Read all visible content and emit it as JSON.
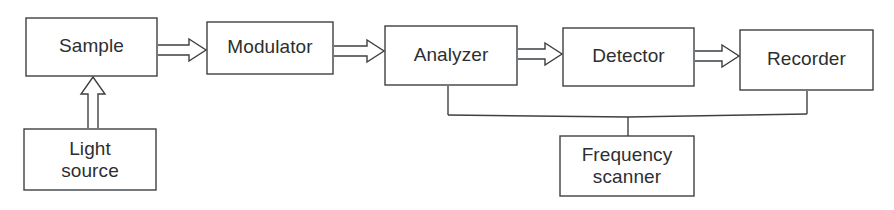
{
  "diagram": {
    "background_color": "#ffffff",
    "line_color": "#3d4043",
    "text_color": "#2c2f31",
    "blocks": [
      {
        "id": "sample",
        "label": "Sample",
        "label_line2": "",
        "x": 26,
        "y": 18,
        "w": 131,
        "h": 58
      },
      {
        "id": "light-source",
        "label": "Light",
        "label_line2": "source",
        "x": 24,
        "y": 129,
        "w": 132,
        "h": 61
      },
      {
        "id": "modulator",
        "label": "Modulator",
        "label_line2": "",
        "x": 207,
        "y": 22,
        "w": 126,
        "h": 52
      },
      {
        "id": "analyzer",
        "label": "Analyzer",
        "label_line2": "",
        "x": 385,
        "y": 26,
        "w": 132,
        "h": 59
      },
      {
        "id": "detector",
        "label": "Detector",
        "label_line2": "",
        "x": 563,
        "y": 28,
        "w": 131,
        "h": 58
      },
      {
        "id": "recorder",
        "label": "Recorder",
        "label_line2": "",
        "x": 740,
        "y": 30,
        "w": 133,
        "h": 60
      },
      {
        "id": "frequency-scanner",
        "label": "Frequency",
        "label_line2": "scanner",
        "x": 560,
        "y": 136,
        "w": 134,
        "h": 60
      }
    ],
    "arrows": [
      {
        "id": "arrow-sample-to-modulator",
        "from": "sample",
        "to": "modulator",
        "direction": "right",
        "x1": 158,
        "x2": 206,
        "cy": 50
      },
      {
        "id": "arrow-modulator-to-analyzer",
        "from": "modulator",
        "to": "analyzer",
        "direction": "right",
        "x1": 334,
        "x2": 384,
        "cy": 51
      },
      {
        "id": "arrow-analyzer-to-detector",
        "from": "analyzer",
        "to": "detector",
        "direction": "right",
        "x1": 518,
        "x2": 562,
        "cy": 54
      },
      {
        "id": "arrow-detector-to-recorder",
        "from": "detector",
        "to": "recorder",
        "direction": "right",
        "x1": 695,
        "x2": 739,
        "cy": 56
      },
      {
        "id": "arrow-light-source-to-sample",
        "from": "light-source",
        "to": "sample",
        "direction": "up",
        "cx": 93,
        "y1": 128,
        "y2": 77
      }
    ],
    "connectors": [
      {
        "id": "connector-analyzer-to-bus",
        "points": "448,86 448,115"
      },
      {
        "id": "connector-bus-horizontal",
        "points": "448,115 628,117 807,114"
      },
      {
        "id": "connector-bus-to-frequency-scanner",
        "points": "628,117 628,136"
      },
      {
        "id": "connector-recorder-to-bus",
        "points": "807,91 807,114"
      }
    ]
  }
}
